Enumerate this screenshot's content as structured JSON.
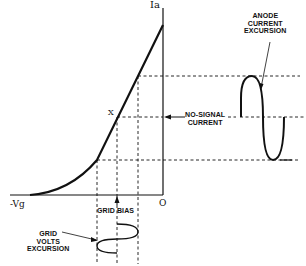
{
  "diagram": {
    "type": "valve grid-volts / anode-current transfer characteristic",
    "axes": {
      "y_label": "Ia",
      "x_label": "-Vg",
      "origin_label": "O"
    },
    "points": {
      "operating_point": "X"
    },
    "labels": {
      "anode_current_excursion": "ANODE\nCURRENT\nEXCURSION",
      "no_signal_current": "NO-SIGNAL\nCURRENT",
      "grid_bias": "GRID BIAS",
      "grid_volts_excursion": "GRID\nVOLTS\nEXCURSION"
    },
    "colors": {
      "ink": "#111111",
      "background": "#ffffff"
    }
  }
}
